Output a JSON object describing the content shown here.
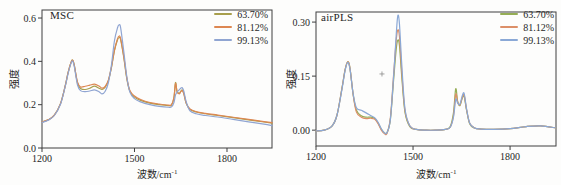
{
  "figure": {
    "background": "#fdfdfc",
    "axis_color": "#3f3f3f",
    "text_color": "#1f1f1f"
  },
  "chart_data": [
    {
      "type": "line",
      "title": "MSC",
      "xlabel": "波数/cm⁻¹",
      "xlabel_base": "波数/cm",
      "xlabel_sup": "-1",
      "ylabel": "强度",
      "xlim": [
        1200,
        1946
      ],
      "ylim": [
        0,
        0.637
      ],
      "x_tick_values": [
        1200,
        1500,
        1800
      ],
      "x_tick_labels": [
        "1200",
        "1500",
        "1800"
      ],
      "y_tick_values": [
        0,
        0.2,
        0.4,
        0.6
      ],
      "y_tick_labels": [
        "0.0",
        "0.2",
        "0.4",
        "0.6"
      ],
      "grid": false,
      "legend_position": "top-right",
      "x": [
        1200,
        1220,
        1240,
        1260,
        1275,
        1285,
        1295,
        1300,
        1305,
        1315,
        1325,
        1340,
        1355,
        1370,
        1385,
        1395,
        1405,
        1415,
        1425,
        1435,
        1445,
        1450,
        1455,
        1465,
        1475,
        1485,
        1500,
        1520,
        1550,
        1580,
        1610,
        1620,
        1628,
        1633,
        1638,
        1645,
        1650,
        1655,
        1660,
        1668,
        1680,
        1700,
        1730,
        1770,
        1820,
        1870,
        1920,
        1946
      ],
      "series": [
        {
          "name": "63.70%",
          "color": "#a89f4d",
          "values": [
            0.12,
            0.13,
            0.152,
            0.205,
            0.285,
            0.35,
            0.398,
            0.405,
            0.38,
            0.3,
            0.275,
            0.27,
            0.276,
            0.286,
            0.276,
            0.27,
            0.281,
            0.31,
            0.37,
            0.45,
            0.5,
            0.51,
            0.5,
            0.42,
            0.32,
            0.262,
            0.235,
            0.22,
            0.207,
            0.2,
            0.196,
            0.198,
            0.232,
            0.302,
            0.262,
            0.252,
            0.262,
            0.268,
            0.252,
            0.205,
            0.178,
            0.166,
            0.158,
            0.15,
            0.14,
            0.13,
            0.12,
            0.115
          ]
        },
        {
          "name": "81.12%",
          "color": "#dd8752",
          "values": [
            0.12,
            0.13,
            0.152,
            0.205,
            0.285,
            0.35,
            0.398,
            0.404,
            0.38,
            0.305,
            0.282,
            0.285,
            0.29,
            0.295,
            0.286,
            0.276,
            0.285,
            0.312,
            0.372,
            0.452,
            0.505,
            0.517,
            0.505,
            0.425,
            0.325,
            0.265,
            0.24,
            0.224,
            0.21,
            0.203,
            0.198,
            0.2,
            0.234,
            0.298,
            0.26,
            0.25,
            0.26,
            0.265,
            0.25,
            0.206,
            0.18,
            0.168,
            0.16,
            0.152,
            0.142,
            0.132,
            0.122,
            0.117
          ]
        },
        {
          "name": "99.13%",
          "color": "#90a5d2",
          "values": [
            0.118,
            0.128,
            0.15,
            0.202,
            0.282,
            0.346,
            0.394,
            0.4,
            0.374,
            0.292,
            0.265,
            0.26,
            0.263,
            0.268,
            0.26,
            0.25,
            0.262,
            0.3,
            0.38,
            0.495,
            0.555,
            0.568,
            0.556,
            0.448,
            0.33,
            0.258,
            0.228,
            0.213,
            0.2,
            0.192,
            0.188,
            0.19,
            0.21,
            0.245,
            0.258,
            0.268,
            0.276,
            0.278,
            0.262,
            0.212,
            0.172,
            0.158,
            0.15,
            0.143,
            0.132,
            0.121,
            0.11,
            0.103
          ]
        }
      ],
      "annotations": []
    },
    {
      "type": "line",
      "title": "airPLS",
      "xlabel": "波数/cm⁻¹",
      "xlabel_base": "波数/cm",
      "xlabel_sup": "-1",
      "ylabel": "强度",
      "xlim": [
        1200,
        1942
      ],
      "ylim": [
        -0.044,
        0.328
      ],
      "x_tick_values": [
        1200,
        1500,
        1800
      ],
      "x_tick_labels": [
        "1200",
        "1500",
        "1800"
      ],
      "y_tick_values": [
        0,
        0.15,
        0.3
      ],
      "y_tick_labels": [
        "0.00",
        "0.15",
        "0.30"
      ],
      "grid": false,
      "legend_position": "top-right",
      "x": [
        1200,
        1225,
        1250,
        1265,
        1280,
        1290,
        1298,
        1305,
        1315,
        1325,
        1340,
        1355,
        1370,
        1382,
        1392,
        1402,
        1412,
        1420,
        1430,
        1440,
        1448,
        1453,
        1458,
        1465,
        1475,
        1490,
        1510,
        1540,
        1570,
        1600,
        1615,
        1625,
        1632,
        1638,
        1645,
        1652,
        1658,
        1665,
        1675,
        1690,
        1710,
        1750,
        1800,
        1850,
        1895,
        1942
      ],
      "series": [
        {
          "name": "63.70%",
          "color": "#95ad55",
          "values": [
            -0.002,
            0.0,
            0.012,
            0.042,
            0.115,
            0.168,
            0.19,
            0.172,
            0.098,
            0.055,
            0.04,
            0.036,
            0.036,
            0.032,
            0.02,
            0.002,
            -0.008,
            -0.006,
            0.03,
            0.14,
            0.225,
            0.25,
            0.235,
            0.15,
            0.05,
            0.01,
            0.002,
            0.0,
            0.0,
            0.002,
            0.01,
            0.048,
            0.115,
            0.08,
            0.068,
            0.088,
            0.094,
            0.058,
            0.018,
            0.006,
            0.003,
            0.002,
            0.004,
            0.01,
            0.012,
            0.006
          ]
        },
        {
          "name": "81.12%",
          "color": "#dc8f68",
          "values": [
            -0.002,
            0.0,
            0.012,
            0.042,
            0.115,
            0.168,
            0.19,
            0.172,
            0.098,
            0.05,
            0.036,
            0.032,
            0.033,
            0.03,
            0.018,
            0.0,
            -0.01,
            -0.008,
            0.035,
            0.155,
            0.25,
            0.278,
            0.26,
            0.165,
            0.055,
            0.012,
            0.002,
            0.0,
            0.0,
            0.002,
            0.008,
            0.04,
            0.1,
            0.078,
            0.07,
            0.09,
            0.098,
            0.06,
            0.02,
            0.006,
            0.003,
            0.002,
            0.004,
            0.01,
            0.012,
            0.006
          ]
        },
        {
          "name": "99.13%",
          "color": "#8aa8d6",
          "values": [
            -0.002,
            0.0,
            0.012,
            0.042,
            0.112,
            0.165,
            0.188,
            0.17,
            0.1,
            0.062,
            0.055,
            0.048,
            0.04,
            0.034,
            0.022,
            0.004,
            -0.008,
            -0.006,
            0.03,
            0.15,
            0.265,
            0.318,
            0.295,
            0.185,
            0.06,
            0.012,
            0.002,
            0.0,
            0.0,
            0.002,
            0.008,
            0.036,
            0.085,
            0.075,
            0.072,
            0.095,
            0.102,
            0.062,
            0.02,
            0.006,
            0.003,
            0.002,
            0.004,
            0.01,
            0.012,
            0.006
          ]
        }
      ],
      "annotations": [
        {
          "text": "+",
          "x": 1404,
          "y": 0.156
        }
      ]
    }
  ]
}
